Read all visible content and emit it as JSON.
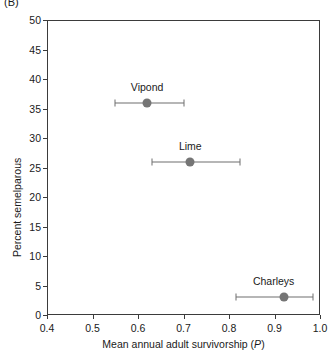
{
  "panel": {
    "label": "(B)"
  },
  "chart_data": {
    "type": "scatter",
    "title": "",
    "panel_label": "(B)",
    "xlabel": "Mean annual adult survivorship (P)",
    "ylabel": "Percent semelparous",
    "xlim": [
      0.4,
      1.0
    ],
    "ylim": [
      0,
      50
    ],
    "xticks": [
      "0.4",
      "0.5",
      "0.6",
      "0.7",
      "0.8",
      "0.9",
      "1.0"
    ],
    "xtick_values": [
      0.4,
      0.5,
      0.6,
      0.7,
      0.8,
      0.9,
      1.0
    ],
    "yticks": [
      "0",
      "5",
      "10",
      "15",
      "20",
      "25",
      "30",
      "35",
      "40",
      "45",
      "50"
    ],
    "ytick_values": [
      0,
      5,
      10,
      15,
      20,
      25,
      30,
      35,
      40,
      45,
      50
    ],
    "grid": false,
    "legend": "none",
    "error_bars": "horizontal",
    "marker_color": "#757575",
    "axis_color": "#3b3b3b",
    "points": [
      {
        "label": "Vipond",
        "x": 0.62,
        "y": 36,
        "x_err_low": 0.55,
        "x_err_high": 0.7,
        "label_dx": 0,
        "label_dy": -10
      },
      {
        "label": "Lime",
        "x": 0.715,
        "y": 26,
        "x_err_low": 0.63,
        "x_err_high": 0.825,
        "label_dx": 0,
        "label_dy": -10
      },
      {
        "label": "Charleys",
        "x": 0.92,
        "y": 3,
        "x_err_low": 0.815,
        "x_err_high": 0.985,
        "label_dx": -10,
        "label_dy": -10
      }
    ]
  }
}
